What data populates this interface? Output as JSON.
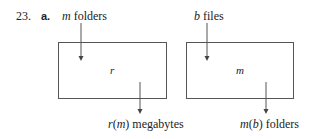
{
  "problem": {
    "number": "23.",
    "part": "a."
  },
  "diagrams": [
    {
      "input_var": "m",
      "input_text": " folders",
      "box_label": "r",
      "output_fn": "r",
      "output_arg": "m",
      "output_text": " megabytes"
    },
    {
      "input_var": "b",
      "input_text": " files",
      "box_label": "m",
      "output_fn": "m",
      "output_arg": "b",
      "output_text": " folders"
    }
  ],
  "colors": {
    "line": "#555555",
    "text": "#222222"
  }
}
